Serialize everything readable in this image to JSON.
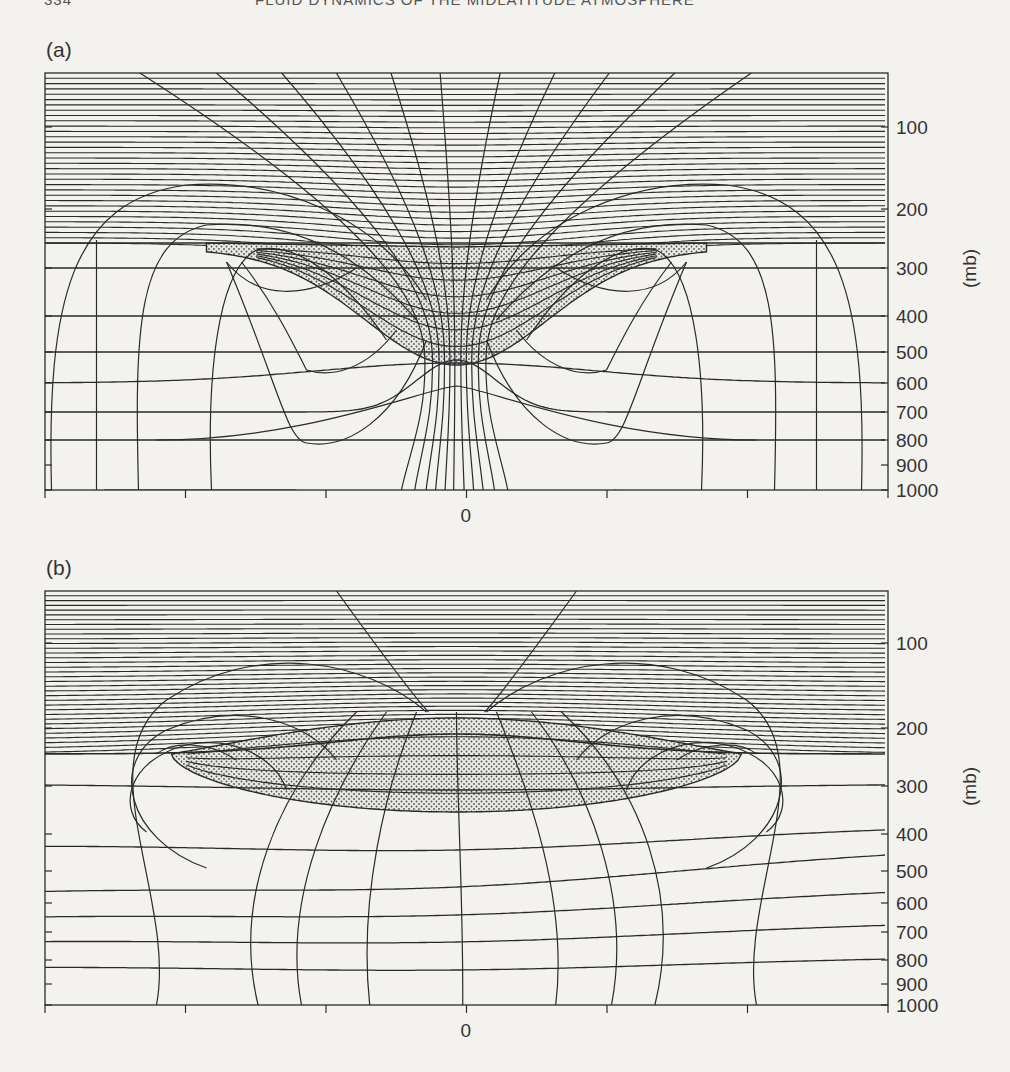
{
  "page": {
    "page_number": "334",
    "running_header": "Fluid Dynamics of the Midlatitude Atmosphere"
  },
  "figure": {
    "panels": [
      {
        "id": "a",
        "label": "(a)",
        "description": "Cross-section: isentropes (near-horizontal lines) and PV/wind contours around an upper-level positive PV anomaly; stippled anomaly region below a lowered tropopause",
        "frame": {
          "x0": 45,
          "x1": 888,
          "top": 73,
          "bottom": 490
        },
        "tropopause_y": 243,
        "y_axis": {
          "label": "(mb)",
          "ticks": [
            {
              "value": "100",
              "y": 127
            },
            {
              "value": "200",
              "y": 209
            },
            {
              "value": "300",
              "y": 268
            },
            {
              "value": "400",
              "y": 316
            },
            {
              "value": "500",
              "y": 352
            },
            {
              "value": "600",
              "y": 383
            },
            {
              "value": "700",
              "y": 412
            },
            {
              "value": "800",
              "y": 440
            },
            {
              "value": "900",
              "y": 465
            },
            {
              "value": "1000",
              "y": 490
            }
          ]
        },
        "x_axis": {
          "center_label": "0",
          "tick_count": 7
        }
      },
      {
        "id": "b",
        "label": "(b)",
        "description": "Cross-section: isentropes and contours for a broad upper-level PV anomaly; stippled lens-shaped anomaly region centered near 200-300 mb",
        "frame": {
          "x0": 45,
          "x1": 888,
          "top": 591,
          "bottom": 1005
        },
        "tropopause_y": 754,
        "y_axis": {
          "label": "(mb)",
          "ticks": [
            {
              "value": "100",
              "y": 643
            },
            {
              "value": "200",
              "y": 728
            },
            {
              "value": "300",
              "y": 786
            },
            {
              "value": "400",
              "y": 834
            },
            {
              "value": "500",
              "y": 871
            },
            {
              "value": "600",
              "y": 903
            },
            {
              "value": "700",
              "y": 932
            },
            {
              "value": "800",
              "y": 960
            },
            {
              "value": "900",
              "y": 984
            },
            {
              "value": "1000",
              "y": 1005
            }
          ]
        },
        "x_axis": {
          "center_label": "0",
          "tick_count": 7
        }
      }
    ]
  },
  "chart_data": [
    {
      "type": "diagram",
      "title": "(a)",
      "xlabel": "",
      "ylabel": "(mb)",
      "x_ticks": [
        "",
        "",
        "",
        "0",
        "",
        "",
        ""
      ],
      "y_ticks": [
        100,
        200,
        300,
        400,
        500,
        600,
        700,
        800,
        900,
        1000
      ],
      "ylim": [
        1000,
        0
      ],
      "stratosphere_hatched": true,
      "tropopause_level_mb_far_field": 250,
      "anomaly_shaded": {
        "center_x": 0,
        "top_mb": 250,
        "bottom_mb": 500
      }
    },
    {
      "type": "diagram",
      "title": "(b)",
      "xlabel": "",
      "ylabel": "(mb)",
      "x_ticks": [
        "",
        "",
        "",
        "0",
        "",
        "",
        ""
      ],
      "y_ticks": [
        100,
        200,
        300,
        400,
        500,
        600,
        700,
        800,
        900,
        1000
      ],
      "ylim": [
        1000,
        0
      ],
      "stratosphere_hatched": true,
      "tropopause_level_mb_far_field": 250,
      "anomaly_shaded": {
        "center_x": 0,
        "top_mb": 180,
        "bottom_mb": 310
      }
    }
  ],
  "colors": {
    "paper": "#f3f2ef",
    "ink": "#2a2a2a",
    "stipple": "#555555"
  }
}
